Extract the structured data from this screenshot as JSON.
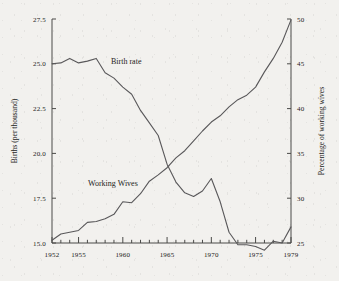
{
  "chart_data": {
    "type": "line",
    "title": "",
    "xlabel": "",
    "ylabel": "Births (per thousand)",
    "y2label": "Percentage of working wives",
    "grid": false,
    "legend_position": "inline-annotations",
    "xlim": [
      1952,
      1979
    ],
    "ylim": [
      15.0,
      27.5
    ],
    "y2lim": [
      25,
      50
    ],
    "xticks": [
      1952,
      1953,
      1954,
      1955,
      1956,
      1957,
      1958,
      1959,
      1960,
      1961,
      1962,
      1963,
      1964,
      1965,
      1966,
      1967,
      1968,
      1969,
      1970,
      1971,
      1972,
      1973,
      1974,
      1975,
      1976,
      1977,
      1978,
      1979
    ],
    "xticklabels": [
      "1952",
      "1955",
      "1960",
      "1965",
      "1970",
      "1975",
      "1979"
    ],
    "xticklabel_years": [
      1952,
      1955,
      1960,
      1965,
      1970,
      1975,
      1979
    ],
    "yticklabels": [
      "27.5",
      "25.0",
      "22.5",
      "20.0",
      "17.5",
      "15.0"
    ],
    "yticks": [
      27.5,
      25.0,
      22.5,
      20.0,
      17.5,
      15.0
    ],
    "y2ticklabels": [
      "50",
      "45",
      "40",
      "35",
      "30",
      "25"
    ],
    "y2ticks": [
      50,
      45,
      40,
      35,
      30,
      25
    ],
    "x": [
      1952,
      1953,
      1954,
      1955,
      1956,
      1957,
      1958,
      1959,
      1960,
      1961,
      1962,
      1963,
      1964,
      1965,
      1966,
      1967,
      1968,
      1969,
      1970,
      1971,
      1972,
      1973,
      1974,
      1975,
      1976,
      1977,
      1978,
      1979
    ],
    "series": [
      {
        "name": "Birth rate",
        "axis": "left",
        "units": "births per thousand",
        "annotation": "Birth rate",
        "values": [
          25.0,
          25.05,
          25.3,
          25.05,
          25.15,
          25.3,
          24.5,
          24.2,
          23.7,
          23.3,
          22.4,
          21.7,
          21.0,
          19.4,
          18.4,
          17.8,
          17.6,
          17.9,
          18.6,
          17.3,
          15.6,
          14.9,
          14.9,
          14.8,
          14.6,
          15.1,
          15.0,
          15.9
        ]
      },
      {
        "name": "Working Wives",
        "axis": "right",
        "units": "percent",
        "annotation": "Working Wives",
        "values": [
          25.3,
          26.0,
          26.2,
          26.4,
          27.3,
          27.4,
          27.7,
          28.2,
          29.6,
          29.5,
          30.5,
          31.9,
          32.6,
          33.4,
          34.5,
          35.3,
          36.4,
          37.5,
          38.5,
          39.2,
          40.2,
          41.0,
          41.5,
          42.4,
          44.1,
          45.6,
          47.4,
          49.9
        ]
      }
    ]
  },
  "annotations": {
    "birth_rate_label": "Birth rate",
    "working_wives_label": "Working Wives"
  },
  "axes": {
    "left_title": "Births (per thousand)",
    "right_title": "Percentage of working wives"
  }
}
